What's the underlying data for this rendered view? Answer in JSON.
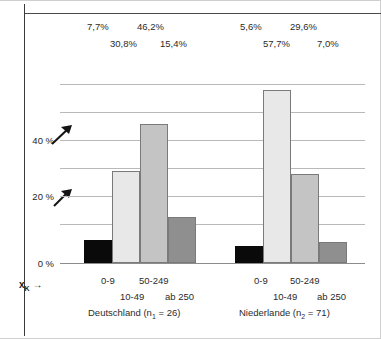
{
  "chart_data": {
    "type": "bar",
    "title": "",
    "xlabel": "x_K",
    "ylabel": "",
    "ylim": [
      0,
      60
    ],
    "grid": true,
    "gridline_values": [
      10,
      20,
      30,
      40,
      50,
      60
    ],
    "ytick_labels": [
      "0 %",
      "20 %",
      "40 %"
    ],
    "ytick_values": [
      0,
      20,
      40
    ],
    "categories": [
      "0-9",
      "10-49",
      "50-249",
      "ab 250"
    ],
    "groups": [
      {
        "name": "Deutschland",
        "n_label": "Deutschland (n1 = 26)",
        "n": 26,
        "values": [
          7.7,
          30.8,
          46.2,
          15.4
        ],
        "value_labels": [
          "7,7%",
          "30,8%",
          "46,2%",
          "15,4%"
        ]
      },
      {
        "name": "Niederlande",
        "n_label": "Niederlande (n2 = 71)",
        "n": 71,
        "values": [
          5.6,
          57.7,
          29.6,
          7.0
        ],
        "value_labels": [
          "5,6%",
          "57,7%",
          "29,6%",
          "7,0%"
        ]
      }
    ],
    "series_colors": [
      "#0a0a0a",
      "#e8e8e8",
      "#c4c4c4",
      "#8f8f8f"
    ],
    "legend_position": "below-axis"
  },
  "axis": {
    "tick0": "0 %",
    "tick20": "20 %",
    "tick40": "40 %",
    "xk_label": "x",
    "xk_sub": "K",
    "xk_arrow": "→"
  },
  "top_labels": {
    "de": {
      "row1_left": "7,7%",
      "row1_right": "46,2%",
      "row2_left": "30,8%",
      "row2_right": "15,4%"
    },
    "nl": {
      "row1_left": "5,6%",
      "row1_right": "29,6%",
      "row2_left": "57,7%",
      "row2_right": "7,0%"
    }
  },
  "bottom_labels": {
    "de": {
      "row1_left": "0-9",
      "row1_right": "50-249",
      "row2_left": "10-49",
      "row2_right": "ab 250",
      "title_prefix": "Deutschland (n",
      "title_sub": "1",
      "title_suffix": " = 26)"
    },
    "nl": {
      "row1_left": "0-9",
      "row1_right": "50-249",
      "row2_left": "10-49",
      "row2_right": "ab 250",
      "title_prefix": "Niederlande (n",
      "title_sub": "2",
      "title_suffix": " = 71)"
    }
  }
}
